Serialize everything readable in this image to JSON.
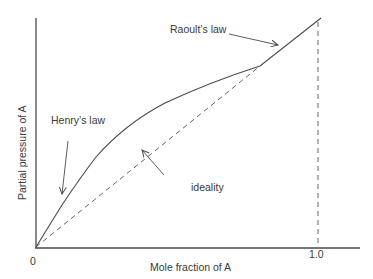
{
  "diagram": {
    "axes": {
      "xlabel": "Mole fraction of A",
      "ylabel": "Partial pressure of A",
      "x_ticks": [
        {
          "label": "0",
          "value": 0
        },
        {
          "label": "1.0",
          "value": 1.0
        }
      ]
    },
    "curves": [
      {
        "name": "real-solution-curve",
        "style": "solid"
      },
      {
        "name": "ideality-line",
        "style": "dashed"
      },
      {
        "name": "x-equals-1-guide",
        "style": "dashed"
      }
    ],
    "annotations": {
      "henry": "Henry’s law",
      "raoult": "Raoult’s law",
      "ideality": "ideality"
    },
    "colors": {
      "line": "#4a4a4a",
      "text": "#3a3a3a",
      "background": "#ffffff"
    }
  }
}
